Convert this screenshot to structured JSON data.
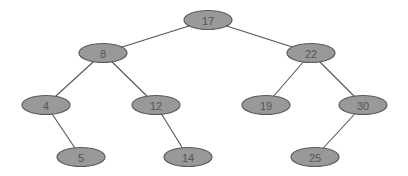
{
  "diagram": {
    "type": "binary-search-tree",
    "node_fill": "#999999",
    "node_stroke": "#5a5a5a",
    "edge_color": "#555555",
    "nodes": [
      {
        "id": "n17",
        "label": "17",
        "x": 208,
        "y": 20
      },
      {
        "id": "n8",
        "label": "8",
        "x": 103,
        "y": 53
      },
      {
        "id": "n22",
        "label": "22",
        "x": 311,
        "y": 53
      },
      {
        "id": "n4",
        "label": "4",
        "x": 46,
        "y": 105
      },
      {
        "id": "n12",
        "label": "12",
        "x": 156,
        "y": 105
      },
      {
        "id": "n19",
        "label": "19",
        "x": 266,
        "y": 105
      },
      {
        "id": "n30",
        "label": "30",
        "x": 363,
        "y": 105
      },
      {
        "id": "n5",
        "label": "5",
        "x": 81,
        "y": 157
      },
      {
        "id": "n14",
        "label": "14",
        "x": 188,
        "y": 157
      },
      {
        "id": "n25",
        "label": "25",
        "x": 315,
        "y": 157
      }
    ],
    "edges": [
      {
        "from": "n17",
        "to": "n8"
      },
      {
        "from": "n17",
        "to": "n22"
      },
      {
        "from": "n8",
        "to": "n4"
      },
      {
        "from": "n8",
        "to": "n12"
      },
      {
        "from": "n22",
        "to": "n19"
      },
      {
        "from": "n22",
        "to": "n30"
      },
      {
        "from": "n4",
        "to": "n5"
      },
      {
        "from": "n12",
        "to": "n14"
      },
      {
        "from": "n30",
        "to": "n25"
      }
    ]
  }
}
